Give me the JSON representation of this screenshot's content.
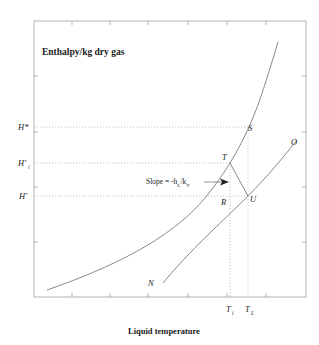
{
  "diagram": {
    "title": "Enthalpy/kg dry gas",
    "xlabel": "Liquid temperature",
    "y_labels": {
      "h_star": "H*",
      "h_i": "H'",
      "h_i_sub": "i",
      "h_prime": "H'"
    },
    "x_labels": {
      "t_i": "T",
      "t_i_sub": "i",
      "t_l": "T",
      "t_l_sub": "L"
    },
    "points": {
      "s": "S",
      "t": "T",
      "u": "U",
      "r": "R",
      "n": "N",
      "o": "O"
    },
    "slope_label": {
      "prefix": "Slope = -h",
      "sub1": "L",
      "mid": "/k",
      "sub2": "Y"
    },
    "colors": {
      "line": "#8a8a8a",
      "axis": "#9a9a9a",
      "dotted": "#b0b0b0",
      "text": "#222222"
    }
  }
}
